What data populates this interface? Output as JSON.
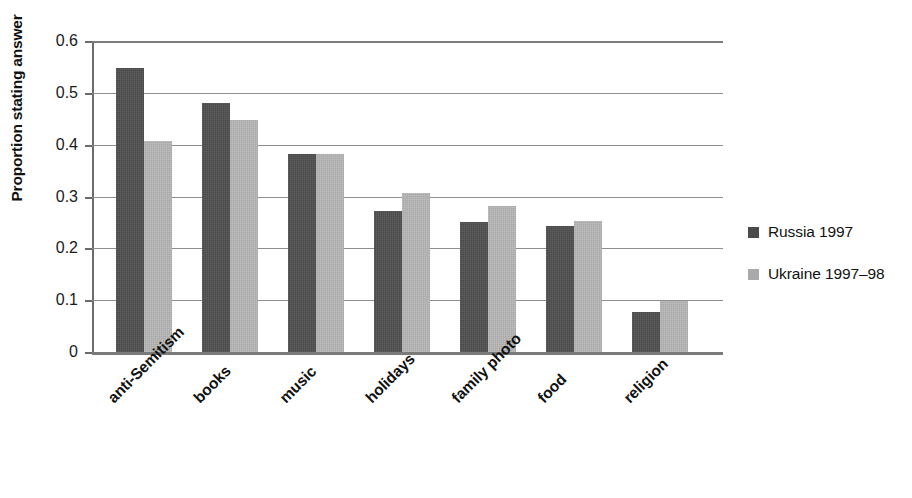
{
  "chart_data": {
    "type": "bar",
    "title": "",
    "xlabel": "",
    "ylabel": "Proportion stating answer",
    "ylim": [
      0,
      0.6
    ],
    "ytick_values": [
      0,
      0.1,
      0.2,
      0.3,
      0.4,
      0.5,
      0.6
    ],
    "ytick_labels": [
      "0",
      "0.1",
      "0.2",
      "0.3",
      "0.4",
      "0.5",
      "0.6"
    ],
    "grid": "horizontal",
    "legend_position": "right",
    "categories": [
      "anti-Semitism",
      "books",
      "music",
      "holidays",
      "family photo",
      "food",
      "religion"
    ],
    "series": [
      {
        "name": "Russia 1997",
        "color": "#4a4a4a",
        "values": [
          0.547,
          0.48,
          0.382,
          0.273,
          0.25,
          0.243,
          0.078
        ]
      },
      {
        "name": "Ukraine 1997–98",
        "color": "#a9a9a9",
        "values": [
          0.408,
          0.447,
          0.382,
          0.306,
          0.282,
          0.252,
          0.099
        ]
      }
    ]
  },
  "legend": {
    "items": [
      {
        "label": "Russia 1997",
        "color": "#4a4a4a"
      },
      {
        "label": "Ukraine 1997–98",
        "color": "#a9a9a9"
      }
    ]
  },
  "colors": {
    "series_dark": "#4a4a4a",
    "series_light": "#a9a9a9",
    "gridline": "#8e8e8e",
    "axis": "#6b6b6b",
    "background": "#ffffff",
    "text": "#111111"
  }
}
